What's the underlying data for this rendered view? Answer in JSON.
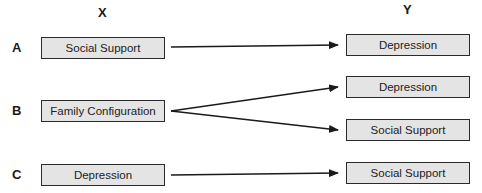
{
  "columns": {
    "x": "X",
    "y": "Y"
  },
  "rows": [
    {
      "label": "A",
      "x_box": "Social Support",
      "y_boxes": [
        "Depression"
      ]
    },
    {
      "label": "B",
      "x_box": "Family Configuration",
      "y_boxes": [
        "Depression",
        "Social Support"
      ]
    },
    {
      "label": "C",
      "x_box": "Depression",
      "y_boxes": [
        "Social Support"
      ]
    }
  ],
  "colors": {
    "box_fill": "#e4e4e4",
    "box_border": "#2a2a2a",
    "arrow": "#1a1a1a"
  }
}
